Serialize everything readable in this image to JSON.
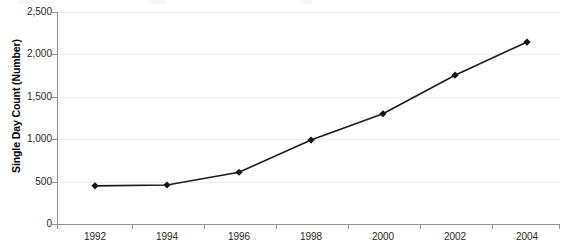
{
  "chart_data": {
    "type": "line",
    "title": "",
    "subtitle": "",
    "xlabel": "",
    "ylabel": "Single Day Count (Number)",
    "x": [
      1992,
      1994,
      1996,
      1998,
      2000,
      2002,
      2004
    ],
    "categories": [
      "1992",
      "1994",
      "1996",
      "1998",
      "2000",
      "2002",
      "2004"
    ],
    "values": [
      450,
      460,
      610,
      990,
      1300,
      1755,
      2145
    ],
    "series": [
      {
        "name": "Single Day Count",
        "values": [
          450,
          460,
          610,
          990,
          1300,
          1755,
          2145
        ]
      }
    ],
    "ylim": [
      0,
      2500
    ],
    "xlim": [
      1991,
      2005
    ],
    "ytick_values": [
      0,
      500,
      1000,
      1500,
      2000,
      2500
    ],
    "ytick_labels": [
      "0",
      "500",
      "1,000",
      "1,500",
      "2,000",
      "2,500"
    ],
    "xtick_labels": [
      "1992",
      "1994",
      "1996",
      "1998",
      "2000",
      "2002",
      "2004"
    ],
    "grid": "horizontal",
    "legend": "none",
    "marker": "diamond",
    "line_color": "#1a1a1a",
    "grid_color": "#ececec",
    "axis_color": "#8d8d8d"
  },
  "axis": {
    "y_title": "Single Day Count (Number)"
  }
}
